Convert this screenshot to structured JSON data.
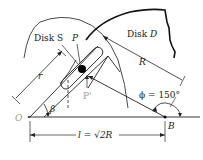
{
  "diagram": {
    "labels": {
      "disk_s": "Disk S",
      "disk_d": "Disk D",
      "disk_d_prefix": "Disk ",
      "disk_d_letter": "D",
      "point_p": "P",
      "point_p_prime": "P'",
      "radius_R": "R",
      "radius_r": "r",
      "angle_beta": "β",
      "angle_phi": "ϕ = 150°",
      "point_O": "O",
      "point_B": "B",
      "distance_l": "l = √2R"
    },
    "colors": {
      "line": "#1a1a1a",
      "disk_outline": "#333333",
      "label_gray": "#9a9a9a"
    }
  }
}
